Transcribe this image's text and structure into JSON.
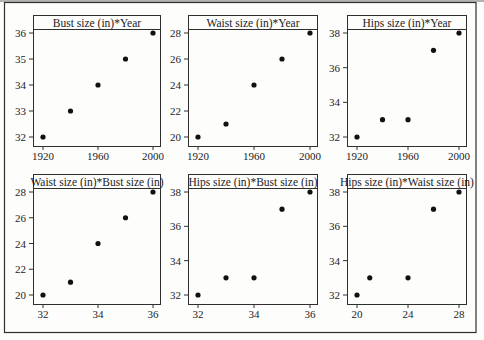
{
  "figure": {
    "background": "#fdfdfc",
    "frame_color": "#2f2f2f",
    "top_rule_color": "#9a9a9a",
    "text_color": "#1c1c1c",
    "point_color": "#111111",
    "panel_fill": "#fdfdfc"
  },
  "chart_data": [
    {
      "type": "scatter",
      "title": "Bust size (in)*Year",
      "xlabel": "",
      "ylabel": "",
      "x_ticks": [
        1920,
        1960,
        2000
      ],
      "y_ticks": [
        32,
        33,
        34,
        35,
        36
      ],
      "xlim": [
        1920,
        2000
      ],
      "ylim": [
        32,
        36
      ],
      "points": [
        [
          1920,
          32
        ],
        [
          1940,
          33
        ],
        [
          1960,
          34
        ],
        [
          1980,
          35
        ],
        [
          2000,
          36
        ]
      ]
    },
    {
      "type": "scatter",
      "title": "Waist size (in)*Year",
      "xlabel": "",
      "ylabel": "",
      "x_ticks": [
        1920,
        1960,
        2000
      ],
      "y_ticks": [
        20,
        22,
        24,
        26,
        28
      ],
      "xlim": [
        1920,
        2000
      ],
      "ylim": [
        20,
        28
      ],
      "points": [
        [
          1920,
          20
        ],
        [
          1940,
          21
        ],
        [
          1960,
          24
        ],
        [
          1980,
          26
        ],
        [
          2000,
          28
        ]
      ]
    },
    {
      "type": "scatter",
      "title": "Hips size (in)*Year",
      "xlabel": "",
      "ylabel": "",
      "x_ticks": [
        1920,
        1960,
        2000
      ],
      "y_ticks": [
        32,
        34,
        36,
        38
      ],
      "xlim": [
        1920,
        2000
      ],
      "ylim": [
        32,
        38
      ],
      "points": [
        [
          1920,
          32
        ],
        [
          1940,
          33
        ],
        [
          1960,
          33
        ],
        [
          1980,
          37
        ],
        [
          2000,
          38
        ]
      ]
    },
    {
      "type": "scatter",
      "title": "Waist size (in)*Bust size (in)",
      "xlabel": "",
      "ylabel": "",
      "x_ticks": [
        32,
        34,
        36
      ],
      "y_ticks": [
        20,
        22,
        24,
        26,
        28
      ],
      "xlim": [
        32,
        36
      ],
      "ylim": [
        20,
        28
      ],
      "points": [
        [
          32,
          20
        ],
        [
          33,
          21
        ],
        [
          34,
          24
        ],
        [
          35,
          26
        ],
        [
          36,
          28
        ]
      ]
    },
    {
      "type": "scatter",
      "title": "Hips size (in)*Bust size (in)",
      "xlabel": "",
      "ylabel": "",
      "x_ticks": [
        32,
        34,
        36
      ],
      "y_ticks": [
        32,
        34,
        36,
        38
      ],
      "xlim": [
        32,
        36
      ],
      "ylim": [
        32,
        38
      ],
      "points": [
        [
          32,
          32
        ],
        [
          33,
          33
        ],
        [
          34,
          33
        ],
        [
          35,
          37
        ],
        [
          36,
          38
        ]
      ]
    },
    {
      "type": "scatter",
      "title": "Hips size (in)*Waist size (in)",
      "xlabel": "",
      "ylabel": "",
      "x_ticks": [
        20,
        24,
        28
      ],
      "y_ticks": [
        32,
        34,
        36,
        38
      ],
      "xlim": [
        20,
        28
      ],
      "ylim": [
        32,
        38
      ],
      "points": [
        [
          20,
          32
        ],
        [
          21,
          33
        ],
        [
          24,
          33
        ],
        [
          26,
          37
        ],
        [
          28,
          38
        ]
      ]
    }
  ]
}
